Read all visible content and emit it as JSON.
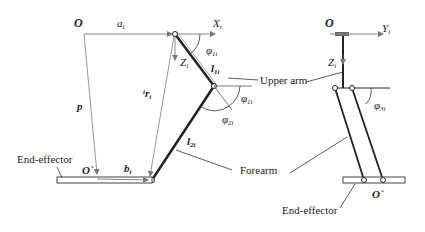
{
  "figure": {
    "left_view": {
      "origin_label": "O",
      "a_label": "a",
      "a_sub": "i",
      "x_axis_label": "X",
      "x_axis_sub": "i",
      "z_axis_label": "Z",
      "z_axis_sub": "i",
      "phi1_label": "φ",
      "phi1_sub": "1i",
      "l1_label": "l",
      "l1_sub": "1i",
      "phi1b_label": "φ",
      "phi1b_sub": "1i",
      "phi2_label": "φ",
      "phi2_sub": "2i",
      "r_label": "r",
      "r_pre": "i",
      "r_sub": "i",
      "p_label": "p",
      "l2_label": "l",
      "l2_sub": "2i",
      "o_prime_label": "O`",
      "b_label": "b",
      "b_sub": "i",
      "upper_arm_label": "Upper arm",
      "forearm_label": "Forearm",
      "end_effector_label": "End-effector"
    },
    "right_view": {
      "origin_label": "O",
      "y_axis_label": "Y",
      "y_axis_sub": "i",
      "z_axis_label": "Z",
      "z_axis_sub": "i",
      "phi3_label": "φ",
      "phi3_sub": "3i",
      "o_prime_label": "O`",
      "end_effector_label": "End-effector"
    },
    "colors": {
      "thin_line": "#888888",
      "thick_line": "#222222",
      "text": "#222222"
    }
  }
}
